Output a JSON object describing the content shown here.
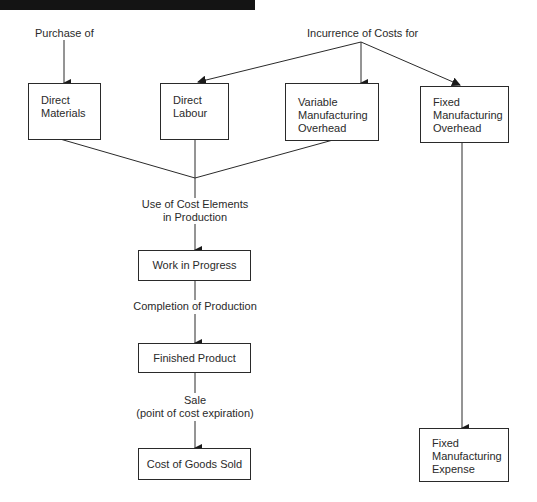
{
  "diagram": {
    "top_labels": {
      "purchase": "Purchase of",
      "incurrence": "Incurrence of Costs for"
    },
    "cost_elements": [
      {
        "id": "direct-materials",
        "lines": [
          "Direct",
          "Materials"
        ]
      },
      {
        "id": "direct-labour",
        "lines": [
          "Direct",
          "Labour"
        ]
      },
      {
        "id": "variable-manufacturing-overhead",
        "lines": [
          "Variable",
          "Manufacturing",
          "Overhead"
        ]
      },
      {
        "id": "fixed-manufacturing-overhead",
        "lines": [
          "Fixed",
          "Manufacturing",
          "Overhead"
        ]
      }
    ],
    "flow_labels": {
      "use": [
        "Use of Cost Elements",
        "in Production"
      ],
      "completion": "Completion of Production",
      "sale": [
        "Sale",
        "(point of cost expiration)"
      ]
    },
    "stages": {
      "work_in_progress": "Work in Progress",
      "finished_product": "Finished Product",
      "cost_of_goods_sold": "Cost of Goods Sold"
    },
    "fixed_expense": [
      "Fixed",
      "Manufacturing",
      "Expense"
    ]
  }
}
